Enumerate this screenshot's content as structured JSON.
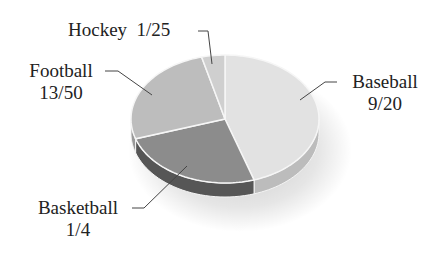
{
  "chart_data": {
    "type": "pie",
    "style": "3d",
    "title": "",
    "categories": [
      "Baseball",
      "Basketball",
      "Football",
      "Hockey"
    ],
    "values": [
      0.45,
      0.25,
      0.26,
      0.04
    ],
    "value_labels": [
      "9/20",
      "1/4",
      "13/50",
      "1/25"
    ],
    "colors": [
      "#e2e2e2",
      "#8c8c8c",
      "#bdbdbd",
      "#cfcfcf"
    ],
    "side_colors": [
      "#bcbcbc",
      "#565656",
      "#9a9a9a",
      "#aaaaaa"
    ],
    "start_angle_deg": 0,
    "direction": "clockwise",
    "legend": "none",
    "labels_position": "outside-with-leader-lines"
  },
  "labels": {
    "hockey": {
      "name": "Hockey",
      "value": "1/25"
    },
    "football": {
      "name": "Football",
      "value": "13/50"
    },
    "baseball": {
      "name": "Baseball",
      "value": "9/20"
    },
    "basketball": {
      "name": "Basketball",
      "value": "1/4"
    }
  }
}
